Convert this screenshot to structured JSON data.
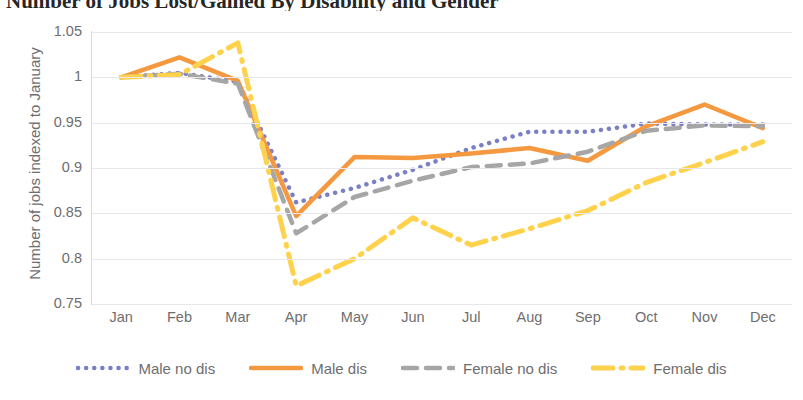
{
  "title": "Number of Jobs Lost/Gained By Disability and Gender",
  "axes": {
    "y_title": "Number of jobs indexed to January",
    "y_ticks": [
      "1.05",
      "1",
      "0.95",
      "0.9",
      "0.85",
      "0.8",
      "0.75"
    ],
    "x_ticks": [
      "Jan",
      "Feb",
      "Mar",
      "Apr",
      "May",
      "Jun",
      "Jul",
      "Aug",
      "Sep",
      "Oct",
      "Nov",
      "Dec"
    ]
  },
  "legend": {
    "items": [
      {
        "label": "Male no dis",
        "color": "#7b7fc4",
        "style": "dotted",
        "swatch": "dotted-line-swatch"
      },
      {
        "label": "Male dis",
        "color": "#f4993f",
        "style": "solid",
        "swatch": "solid-line-swatch"
      },
      {
        "label": "Female no dis",
        "color": "#a6a6a6",
        "style": "dashed",
        "swatch": "dashed-line-swatch"
      },
      {
        "label": "Female dis",
        "color": "#ffd24d",
        "style": "dashdot",
        "swatch": "dashdot-line-swatch"
      }
    ]
  },
  "chart_data": {
    "type": "line",
    "title": "Number of Jobs Lost/Gained By Disability and Gender",
    "xlabel": "",
    "ylabel": "Number of jobs indexed to January",
    "categories": [
      "Jan",
      "Feb",
      "Mar",
      "Apr",
      "May",
      "Jun",
      "Jul",
      "Aug",
      "Sep",
      "Oct",
      "Nov",
      "Dec"
    ],
    "ylim": [
      0.75,
      1.05
    ],
    "ytick_step": 0.05,
    "grid": true,
    "legend_position": "bottom",
    "series": [
      {
        "name": "Male no dis",
        "color": "#7b7fc4",
        "style": "dotted",
        "values": [
          1.0,
          1.005,
          0.995,
          0.862,
          0.878,
          0.898,
          0.922,
          0.94,
          0.94,
          0.949,
          0.948,
          0.948
        ]
      },
      {
        "name": "Male dis",
        "color": "#f4993f",
        "style": "solid",
        "values": [
          1.0,
          1.022,
          0.996,
          0.847,
          0.912,
          0.911,
          0.916,
          0.922,
          0.908,
          0.946,
          0.97,
          0.944
        ]
      },
      {
        "name": "Female no dis",
        "color": "#a6a6a6",
        "style": "dashed",
        "values": [
          1.0,
          1.004,
          0.993,
          0.828,
          0.868,
          0.886,
          0.901,
          0.905,
          0.918,
          0.941,
          0.947,
          0.946
        ]
      },
      {
        "name": "Female dis",
        "color": "#ffd24d",
        "style": "dashdot",
        "values": [
          1.0,
          1.003,
          1.038,
          0.77,
          0.8,
          0.845,
          0.815,
          0.833,
          0.853,
          0.884,
          0.906,
          0.929
        ]
      }
    ]
  }
}
